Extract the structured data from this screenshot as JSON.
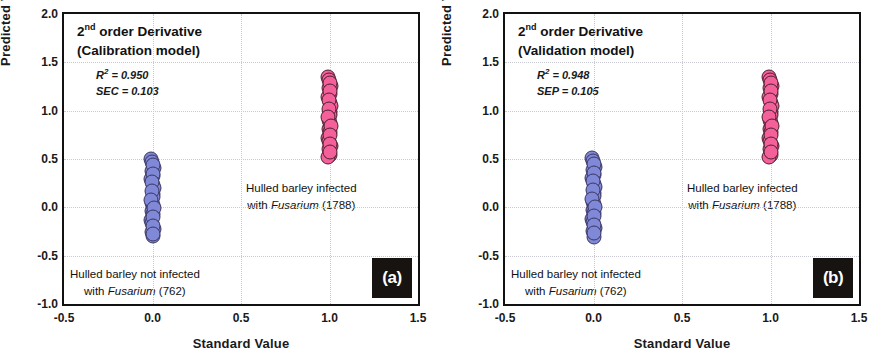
{
  "figure": {
    "xlabel": "Standard Value",
    "ylabel": "Predicted Value"
  },
  "panels": [
    {
      "tag": "(a)",
      "title_line1_prefix": "2",
      "title_line1_sup": "nd",
      "title_line1_suffix": " order Derivative",
      "title_line2": "(Calibration model)",
      "stat1_name": "R",
      "stat1_sup": "2",
      "stat1_value": " = 0.950",
      "stat2": "SEC = 0.103",
      "anno_infected_line1": "Hulled barley infected",
      "anno_infected_line2_pre": "with ",
      "anno_infected_line2_italic": "Fusarium",
      "anno_infected_line2_post": " (1788)",
      "anno_not_infected_line1": "Hulled barley not infected",
      "anno_not_infected_line2_pre": "with ",
      "anno_not_infected_line2_italic": "Fusarium",
      "anno_not_infected_line2_post": " (762)"
    },
    {
      "tag": "(b)",
      "title_line1_prefix": "2",
      "title_line1_sup": "nd",
      "title_line1_suffix": " order Derivative",
      "title_line2": "(Validation model)",
      "stat1_name": "R",
      "stat1_sup": "2",
      "stat1_value": " = 0.948",
      "stat2": "SEP = 0.105",
      "anno_infected_line1": "Hulled barley infected",
      "anno_infected_line2_pre": "with ",
      "anno_infected_line2_italic": "Fusarium",
      "anno_infected_line2_post": " (1788)",
      "anno_not_infected_line1": "Hulled barley not infected",
      "anno_not_infected_line2_pre": "with ",
      "anno_not_infected_line2_italic": "Fusarium",
      "anno_not_infected_line2_post": " (762)"
    }
  ],
  "chart_data": [
    {
      "type": "scatter",
      "title": "2nd order Derivative (Calibration model)",
      "panel": "(a)",
      "xlabel": "Standard Value",
      "ylabel": "Predicted Value",
      "xlim": [
        -0.5,
        1.5
      ],
      "ylim": [
        -1.0,
        2.0
      ],
      "xticks": [
        "-0.5",
        "0.0",
        "0.5",
        "1.0",
        "1.5"
      ],
      "yticks": [
        "-1.0",
        "-0.5",
        "0.0",
        "0.5",
        "1.0",
        "1.5",
        "2.0"
      ],
      "xtick_values": [
        -0.5,
        0.0,
        0.5,
        1.0,
        1.5
      ],
      "ytick_values": [
        -1.0,
        -0.5,
        0.0,
        0.5,
        1.0,
        1.5,
        2.0
      ],
      "grid": true,
      "legend": false,
      "annotations": [
        {
          "text": "R2 = 0.950",
          "x": 0.0,
          "y": 1.27
        },
        {
          "text": "SEC = 0.103",
          "x": 0.0,
          "y": 1.17
        },
        {
          "text": "Hulled barley infected with Fusarium (1788)",
          "x": 0.78,
          "y": 0.33
        },
        {
          "text": "Hulled barley not infected with Fusarium (762)",
          "x": -0.05,
          "y": -0.61
        }
      ],
      "statistics": {
        "R2": 0.95,
        "SEC": 0.103
      },
      "series": [
        {
          "name": "Hulled barley not infected with Fusarium (762)",
          "color": "#8089d8",
          "edge_color": "#3a3560",
          "n_samples": 762,
          "x": 0.0,
          "y_range": [
            -0.3,
            0.5
          ],
          "values": [
            0.5,
            0.47,
            0.44,
            0.41,
            0.38,
            0.35,
            0.32,
            0.29,
            0.26,
            0.23,
            0.2,
            0.17,
            0.14,
            0.11,
            0.08,
            0.05,
            0.02,
            -0.01,
            -0.04,
            -0.07,
            -0.1,
            -0.13,
            -0.16,
            -0.19,
            -0.22,
            -0.25,
            -0.28,
            -0.3
          ]
        },
        {
          "name": "Hulled barley infected with Fusarium (1788)",
          "color": "#f3609a",
          "edge_color": "#4a2030",
          "n_samples": 1788,
          "x": 1.0,
          "y_range": [
            0.52,
            1.35
          ],
          "values": [
            1.35,
            1.32,
            1.29,
            1.26,
            1.23,
            1.2,
            1.17,
            1.14,
            1.11,
            1.08,
            1.05,
            1.02,
            0.99,
            0.96,
            0.93,
            0.9,
            0.87,
            0.84,
            0.81,
            0.78,
            0.75,
            0.72,
            0.69,
            0.66,
            0.63,
            0.6,
            0.57,
            0.54,
            0.52
          ]
        }
      ]
    },
    {
      "type": "scatter",
      "title": "2nd order Derivative (Validation model)",
      "panel": "(b)",
      "xlabel": "Standard Value",
      "ylabel": "Predicted Value",
      "xlim": [
        -0.5,
        1.5
      ],
      "ylim": [
        -1.0,
        2.0
      ],
      "xticks": [
        "-0.5",
        "0.0",
        "0.5",
        "1.0",
        "1.5"
      ],
      "yticks": [
        "-1.0",
        "-0.5",
        "0.0",
        "0.5",
        "1.0",
        "1.5",
        "2.0"
      ],
      "xtick_values": [
        -0.5,
        0.0,
        0.5,
        1.0,
        1.5
      ],
      "ytick_values": [
        -1.0,
        -0.5,
        0.0,
        0.5,
        1.0,
        1.5,
        2.0
      ],
      "grid": true,
      "legend": false,
      "annotations": [
        {
          "text": "R2 = 0.948",
          "x": 0.0,
          "y": 1.27
        },
        {
          "text": "SEP = 0.105",
          "x": 0.0,
          "y": 1.17
        },
        {
          "text": "Hulled barley infected with Fusarium (1788)",
          "x": 0.78,
          "y": 0.33
        },
        {
          "text": "Hulled barley not infected with Fusarium (762)",
          "x": -0.05,
          "y": -0.61
        }
      ],
      "statistics": {
        "R2": 0.948,
        "SEP": 0.105
      },
      "series": [
        {
          "name": "Hulled barley not infected with Fusarium (762)",
          "color": "#8089d8",
          "edge_color": "#3a3560",
          "n_samples": 762,
          "x": 0.0,
          "y_range": [
            -0.31,
            0.51
          ],
          "values": [
            0.51,
            0.48,
            0.45,
            0.42,
            0.39,
            0.36,
            0.33,
            0.3,
            0.27,
            0.24,
            0.21,
            0.18,
            0.15,
            0.12,
            0.09,
            0.06,
            0.03,
            0.0,
            -0.03,
            -0.06,
            -0.09,
            -0.12,
            -0.15,
            -0.18,
            -0.21,
            -0.24,
            -0.27,
            -0.31
          ]
        },
        {
          "name": "Hulled barley infected with Fusarium (1788)",
          "color": "#f3609a",
          "edge_color": "#4a2030",
          "n_samples": 1788,
          "x": 1.0,
          "y_range": [
            0.52,
            1.35
          ],
          "values": [
            1.35,
            1.32,
            1.29,
            1.26,
            1.23,
            1.2,
            1.17,
            1.14,
            1.11,
            1.08,
            1.05,
            1.02,
            0.99,
            0.96,
            0.93,
            0.9,
            0.87,
            0.84,
            0.81,
            0.78,
            0.75,
            0.72,
            0.69,
            0.66,
            0.63,
            0.6,
            0.57,
            0.54,
            0.52
          ]
        }
      ]
    }
  ]
}
